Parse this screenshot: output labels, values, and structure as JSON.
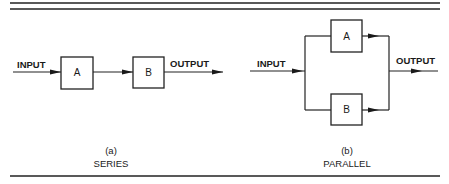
{
  "figure": {
    "series": {
      "input_label": "INPUT",
      "output_label": "OUTPUT",
      "blocks": [
        {
          "label": "A"
        },
        {
          "label": "B"
        }
      ],
      "caption_letter": "(a)",
      "caption_title": "SERIES"
    },
    "parallel": {
      "input_label": "INPUT",
      "output_label": "OUTPUT",
      "blocks": [
        {
          "label": "A"
        },
        {
          "label": "B"
        }
      ],
      "caption_letter": "(b)",
      "caption_title": "PARALLEL"
    }
  }
}
